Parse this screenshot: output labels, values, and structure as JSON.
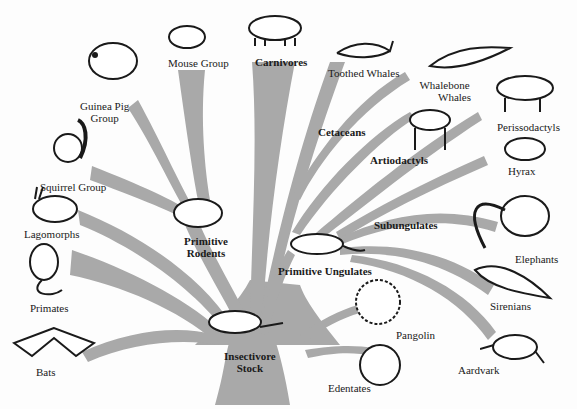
{
  "diagram": {
    "type": "phylogenetic-tree",
    "root": {
      "label_line1": "Insectivore",
      "label_line2": "Stock"
    },
    "branch_color": "#a9a9a9",
    "ink_color": "#1a1a1a",
    "intermediate_groups": {
      "primitive_rodents": {
        "line1": "Primitive",
        "line2": "Rodents"
      },
      "carnivores": "Carnivores",
      "cetaceans": "Cetaceans",
      "artiodactyls": "Artiodactyls",
      "primitive_ungulates": "Primitive Ungulates",
      "subungulates": "Subungulates"
    },
    "terminal_groups": {
      "guinea_pig": {
        "line1": "Guinea Pig",
        "line2": "Group"
      },
      "mouse": "Mouse Group",
      "toothed_whales": "Toothed Whales",
      "whalebone_whales": {
        "line1": "Whalebone",
        "line2": "Whales"
      },
      "perissodactyls": "Perissodactyls",
      "hyrax": "Hyrax",
      "squirrel": "Squirrel Group",
      "lagomorphs": "Lagomorphs",
      "primates": "Primates",
      "bats": "Bats",
      "elephants": "Elephants",
      "sirenians": "Sirenians",
      "pangolin": "Pangolin",
      "aardvark": "Aardvark",
      "edentates": "Edentates"
    }
  }
}
